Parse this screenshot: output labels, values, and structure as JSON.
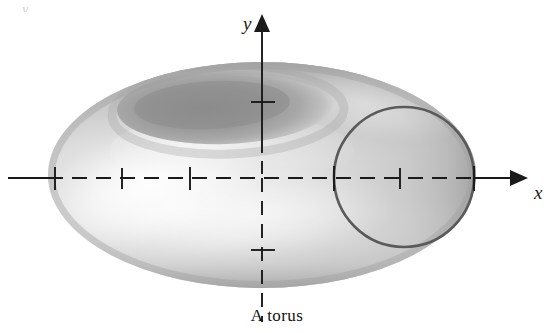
{
  "figure": {
    "caption": "A torus",
    "axis_labels": {
      "y": "y",
      "x": "x"
    },
    "artifact_label": "y,",
    "colors": {
      "background": "#ffffff",
      "axis": "#1a1a1a",
      "circle_stroke": "#5a5a5a",
      "torus_highlight": "#f0f0f0",
      "torus_mid": "#c9c9c9",
      "torus_shadow": "#9a9a9a",
      "hole_dark": "#8f8f8f",
      "caption_text": "#111111"
    },
    "torus": {
      "outer_ellipse": {
        "cx": 262,
        "cy": 175,
        "rx": 214,
        "ry": 113
      },
      "hole_ellipse": {
        "cx": 225,
        "cy": 107,
        "rx": 107,
        "ry": 36
      },
      "description": "Shaded grayscale torus (donut) rendered in perspective"
    },
    "overlay_circle": {
      "cx": 404,
      "cy": 177,
      "r": 70,
      "stroke_width": 2.6
    },
    "axes": {
      "x_axis": {
        "y": 178,
        "x_start": 8,
        "x_end": 520,
        "arrow": "right"
      },
      "y_axis": {
        "x": 262,
        "y_top": 22,
        "y_bottom": 322,
        "arrow": "up"
      },
      "x_ticks": [
        55,
        122,
        190,
        334,
        400,
        474
      ],
      "y_ticks": [
        102,
        250
      ],
      "dash_pattern": "14,9",
      "note": "axes drawn solid outside the torus body and dashed where they cross the shaded surface"
    }
  }
}
